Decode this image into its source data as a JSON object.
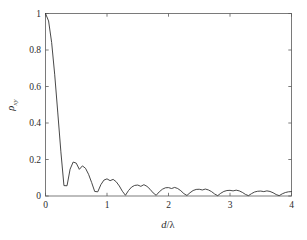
{
  "figure": {
    "background_color": "#ffffff",
    "frame_color": "#5a5a5a",
    "curve_color": "#333333"
  },
  "axis": {
    "x_title": "d/λ",
    "y_title_symbol": "ρ",
    "y_title_subscript": "xy",
    "x_ticklabels": [
      "0",
      "1",
      "2",
      "3",
      "4"
    ],
    "y_ticklabels": [
      "0",
      "0.2",
      "0.4",
      "0.6",
      "0.8",
      "1"
    ]
  },
  "chart_data": {
    "type": "line",
    "title": "",
    "subtitle": "",
    "xlabel": "d/λ",
    "ylabel": "ρxy",
    "xlim": [
      0,
      4
    ],
    "ylim": [
      0,
      1
    ],
    "xticks": [
      0,
      1,
      2,
      3,
      4
    ],
    "yticks": [
      0,
      0.2,
      0.4,
      0.6,
      0.8,
      1
    ],
    "grid": false,
    "legend": null,
    "annotations": [],
    "series": [
      {
        "name": "rho_xy",
        "color": "#333333",
        "x": [
          0.0,
          0.05,
          0.1,
          0.15,
          0.2,
          0.25,
          0.3,
          0.35,
          0.4,
          0.45,
          0.5,
          0.55,
          0.6,
          0.65,
          0.7,
          0.75,
          0.8,
          0.85,
          0.9,
          0.95,
          1.0,
          1.05,
          1.1,
          1.15,
          1.2,
          1.25,
          1.3,
          1.35,
          1.4,
          1.45,
          1.5,
          1.55,
          1.6,
          1.65,
          1.7,
          1.75,
          1.8,
          1.85,
          1.9,
          1.95,
          2.0,
          2.05,
          2.1,
          2.15,
          2.2,
          2.25,
          2.3,
          2.35,
          2.4,
          2.45,
          2.5,
          2.55,
          2.6,
          2.65,
          2.7,
          2.75,
          2.8,
          2.85,
          2.9,
          2.95,
          3.0,
          3.05,
          3.1,
          3.15,
          3.2,
          3.25,
          3.3,
          3.35,
          3.4,
          3.45,
          3.5,
          3.55,
          3.6,
          3.65,
          3.7,
          3.75,
          3.8,
          3.85,
          3.9,
          3.95,
          4.0
        ],
        "y": [
          1.0,
          0.959,
          0.841,
          0.664,
          0.455,
          0.242,
          0.057,
          0.056,
          0.147,
          0.186,
          0.18,
          0.146,
          0.165,
          0.152,
          0.119,
          0.074,
          0.025,
          0.023,
          0.062,
          0.087,
          0.094,
          0.084,
          0.091,
          0.078,
          0.055,
          0.026,
          0.004,
          0.03,
          0.049,
          0.058,
          0.06,
          0.053,
          0.062,
          0.053,
          0.037,
          0.017,
          0.004,
          0.023,
          0.037,
          0.045,
          0.046,
          0.041,
          0.047,
          0.041,
          0.029,
          0.013,
          0.003,
          0.018,
          0.03,
          0.036,
          0.037,
          0.033,
          0.038,
          0.033,
          0.024,
          0.011,
          0.002,
          0.015,
          0.025,
          0.03,
          0.031,
          0.028,
          0.032,
          0.028,
          0.02,
          0.009,
          0.002,
          0.013,
          0.022,
          0.026,
          0.027,
          0.024,
          0.028,
          0.025,
          0.018,
          0.008,
          0.002,
          0.012,
          0.019,
          0.023,
          0.024
        ],
        "lobe_peaks": [
          {
            "x": 0.0,
            "y": 1.0
          },
          {
            "x": 0.6,
            "y": 0.165
          },
          {
            "x": 1.1,
            "y": 0.094
          },
          {
            "x": 1.6,
            "y": 0.062
          },
          {
            "x": 2.1,
            "y": 0.047
          },
          {
            "x": 2.6,
            "y": 0.038
          },
          {
            "x": 3.1,
            "y": 0.032
          },
          {
            "x": 3.6,
            "y": 0.028
          }
        ],
        "zero_crossings": [
          0.32,
          0.83,
          1.33,
          1.82,
          2.32,
          2.82,
          3.32,
          3.82
        ]
      }
    ]
  }
}
